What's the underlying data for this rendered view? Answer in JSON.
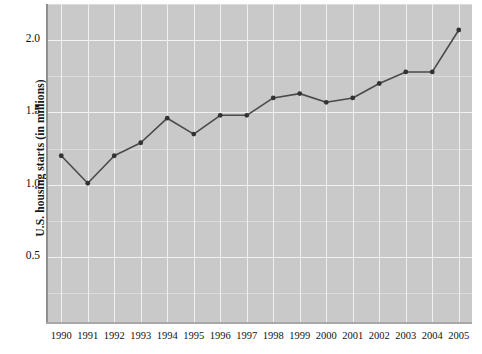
{
  "chart_data": {
    "type": "line",
    "title": "",
    "xlabel": "",
    "ylabel": "U.S. housing starts (in millions)",
    "categories": [
      "1990",
      "1991",
      "1992",
      "1993",
      "1994",
      "1995",
      "1996",
      "1997",
      "1998",
      "1999",
      "2000",
      "2001",
      "2002",
      "2003",
      "2004",
      "2005"
    ],
    "x": [
      1990,
      1991,
      1992,
      1993,
      1994,
      1995,
      1996,
      1997,
      1998,
      1999,
      2000,
      2001,
      2002,
      2003,
      2004,
      2005
    ],
    "values": [
      1.2,
      1.01,
      1.2,
      1.29,
      1.46,
      1.35,
      1.48,
      1.48,
      1.6,
      1.63,
      1.57,
      1.6,
      1.7,
      1.78,
      1.78,
      2.07
    ],
    "series": [
      {
        "name": "U.S. housing starts",
        "values": [
          1.2,
          1.01,
          1.2,
          1.29,
          1.46,
          1.35,
          1.48,
          1.48,
          1.6,
          1.63,
          1.57,
          1.6,
          1.7,
          1.78,
          1.78,
          2.07
        ]
      }
    ],
    "ytick_labels": [
      "0.5",
      "1.0",
      "1.5",
      "2.0"
    ],
    "ytick_values": [
      0.5,
      1.0,
      1.5,
      2.0
    ],
    "ylim": [
      0.05,
      2.25
    ],
    "xlim": [
      1989.5,
      2005.5
    ],
    "grid": true,
    "legend": false,
    "legend_position": "none",
    "marker": "circle",
    "colors": {
      "plot_background": "#c9c9c9",
      "gridline": "#f2f2f2",
      "line": "#4a4a4a",
      "marker": "#333333",
      "axis": "#8f8f8f",
      "text": "#111111"
    }
  }
}
